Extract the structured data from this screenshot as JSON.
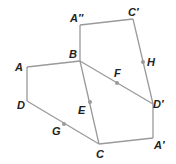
{
  "diagram": {
    "type": "geometry-transformation",
    "colors": {
      "edge": "#9a9a9a",
      "label": "#222222",
      "background": "#ffffff"
    },
    "vertices": {
      "A": {
        "label": "A",
        "x": 27,
        "y": 67
      },
      "B": {
        "label": "B",
        "x": 80,
        "y": 61
      },
      "C": {
        "label": "C",
        "x": 99,
        "y": 144
      },
      "D": {
        "label": "D",
        "x": 27,
        "y": 101
      },
      "A2": {
        "label": "A″",
        "x": 80,
        "y": 25
      },
      "Cp": {
        "label": "C′",
        "x": 133,
        "y": 19
      },
      "Dp": {
        "label": "D′",
        "x": 153,
        "y": 104
      },
      "Ap": {
        "label": "A′",
        "x": 153,
        "y": 138
      }
    },
    "midpoints": {
      "E": {
        "label": "E",
        "x": 90,
        "y": 102
      },
      "F": {
        "label": "F",
        "x": 117,
        "y": 83
      },
      "G": {
        "label": "G",
        "x": 64,
        "y": 124
      },
      "H": {
        "label": "H",
        "x": 143,
        "y": 62
      }
    },
    "quadrilaterals": [
      {
        "name": "ABCD",
        "vertices": [
          "A",
          "B",
          "C",
          "D"
        ]
      },
      {
        "name": "A′BCD′",
        "vertices": [
          "B",
          "Dp",
          "Ap",
          "C"
        ]
      },
      {
        "name": "A″BD′C′",
        "vertices": [
          "A2",
          "Cp",
          "Dp",
          "B"
        ]
      }
    ]
  }
}
